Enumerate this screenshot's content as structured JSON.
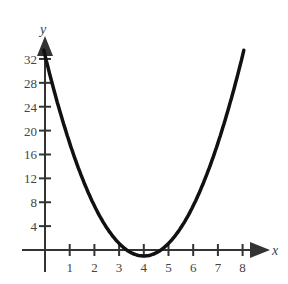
{
  "chart_data": {
    "type": "line",
    "title": "",
    "xlabel": "x",
    "ylabel": "y",
    "xlim": [
      0,
      8.6
    ],
    "ylim": [
      0,
      34
    ],
    "grid": false,
    "x_ticks": [
      1,
      2,
      3,
      4,
      5,
      6,
      7,
      8
    ],
    "x_tick_labels": [
      "1",
      "2",
      "3",
      "4",
      "5",
      "6",
      "7",
      "8"
    ],
    "y_ticks": [
      4,
      8,
      12,
      16,
      20,
      24,
      28,
      32
    ],
    "y_tick_labels": [
      "4",
      "8",
      "12",
      "16",
      "20",
      "24",
      "28",
      "32"
    ],
    "series": [
      {
        "name": "parabola",
        "description": "Upward-opening parabola with vertex near (4, -1)",
        "x": [
          0,
          1,
          2,
          3,
          3.3,
          4,
          4.7,
          5,
          6,
          7,
          8
        ],
        "values": [
          33,
          17,
          7,
          1,
          0,
          -1,
          0,
          1,
          7,
          17,
          33
        ]
      }
    ]
  }
}
